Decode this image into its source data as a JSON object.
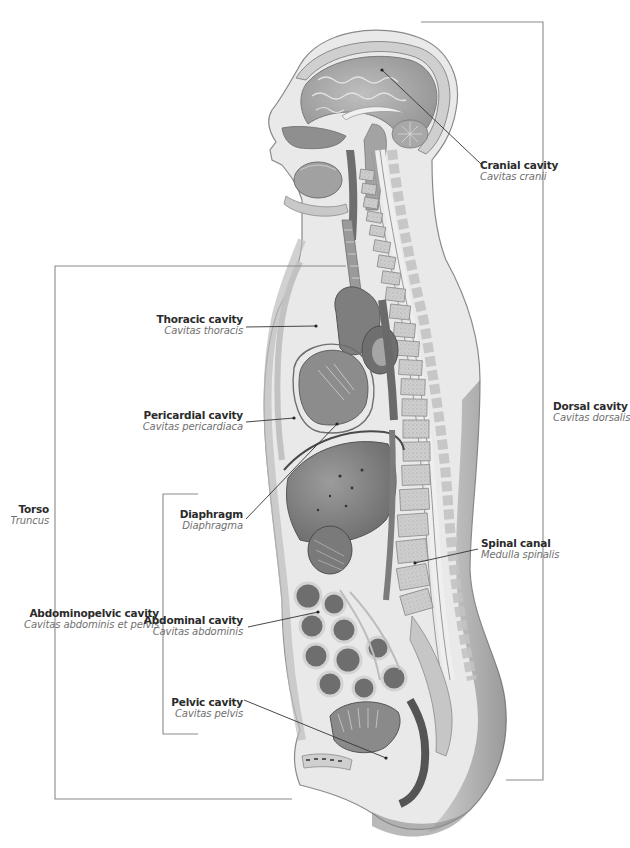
{
  "figure": {
    "colors": {
      "line": "#8a8a8a",
      "leader": "#333333",
      "label_primary": "#2b2b2b",
      "label_secondary": "#6f6f6f",
      "tissue_light": "#e6e6e6",
      "tissue_mid": "#b5b5b5",
      "tissue_dark": "#6a6a6a"
    }
  },
  "labels": {
    "cranial": {
      "en": "Cranial cavity",
      "la": "Cavitas cranii"
    },
    "thoracic": {
      "en": "Thoracic cavity",
      "la": "Cavitas thoracis"
    },
    "pericardial": {
      "en": "Pericardial cavity",
      "la": "Cavitas pericardiaca"
    },
    "diaphragm": {
      "en": "Diaphragm",
      "la": "Diaphragma"
    },
    "torso": {
      "en": "Torso",
      "la": "Truncus"
    },
    "abdominopelvic": {
      "en": "Abdominopelvic cavity",
      "la": "Cavitas abdominis et pelvis"
    },
    "abdominal": {
      "en": "Abdominal cavity",
      "la": "Cavitas abdominis"
    },
    "pelvic": {
      "en": "Pelvic cavity",
      "la": "Cavitas pelvis"
    },
    "dorsal": {
      "en": "Dorsal cavity",
      "la": "Cavitas dorsalis"
    },
    "spinal": {
      "en": "Spinal canal",
      "la": "Medulla spinalis"
    }
  },
  "brackets": {
    "torso": {
      "x": 55,
      "top": 266,
      "bottom": 799,
      "top_end": 346,
      "bottom_end": 292
    },
    "abdominopelvic": {
      "x": 163,
      "top": 494,
      "bottom": 734,
      "top_end": 198,
      "bottom_end": 198
    },
    "dorsal": {
      "x": 543,
      "top": 22,
      "bottom": 780,
      "top_end": 421,
      "bottom_end": 506
    }
  }
}
